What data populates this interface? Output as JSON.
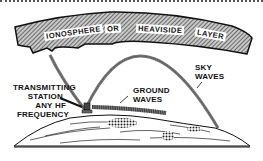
{
  "diagram": {
    "ionosphere_words": [
      "IONOSPHERE",
      "OR",
      "HEAVISIDE",
      "LAYER"
    ],
    "labels": {
      "sky_waves_line1": "SKY",
      "sky_waves_line2": "WAVES",
      "ground_waves_line1": "GROUND",
      "ground_waves_line2": "WAVES",
      "station_line1": "TRANSMITTING",
      "station_line2": "STATION",
      "station_line3": "ANY HF",
      "station_line4": "FREQUENCY"
    }
  },
  "colors": {
    "ink": "#111111",
    "hatch": "#777777",
    "background": "#ffffff"
  }
}
